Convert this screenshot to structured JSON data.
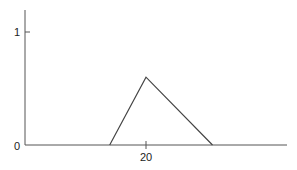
{
  "chart_data": {
    "type": "line",
    "title": "",
    "xlabel": "",
    "ylabel": "",
    "x_ticks": [
      "20"
    ],
    "y_ticks": [
      "0",
      "1"
    ],
    "ylim": [
      0,
      1.25
    ],
    "xlim": [
      0,
      44
    ],
    "grid": false,
    "series": [
      {
        "name": "triangular membership",
        "x": [
          14,
          20,
          31
        ],
        "y": [
          0,
          0.6,
          0
        ]
      }
    ]
  },
  "labels": {
    "y_one": "1",
    "y_zero": "0",
    "x_twenty": "20"
  }
}
